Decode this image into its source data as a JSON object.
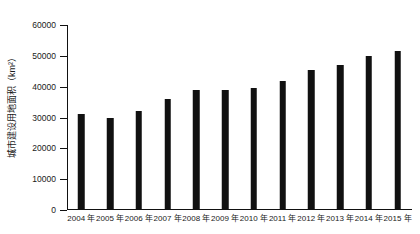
{
  "chart_data": {
    "type": "bar",
    "title": "",
    "xlabel": "",
    "ylabel": "城市建设用地面积（km²）",
    "ylim": [
      0,
      60000
    ],
    "ytick_step": 10000,
    "yticks": [
      "0",
      "10000",
      "20000",
      "30000",
      "40000",
      "50000",
      "60000"
    ],
    "ytick_values": [
      0,
      10000,
      20000,
      30000,
      40000,
      50000,
      60000
    ],
    "grid": false,
    "legend": false,
    "bar_color": "#111111",
    "axis_color": "#111111",
    "categories": [
      "2004 年",
      "2005 年",
      "2006 年",
      "2007 年",
      "2008 年",
      "2009 年",
      "2010 年",
      "2011 年",
      "2012 年",
      "2013 年",
      "2014 年",
      "2015 年"
    ],
    "values": [
      31000,
      30000,
      32000,
      36000,
      39000,
      39000,
      39500,
      42000,
      45500,
      47000,
      50000,
      51500
    ]
  }
}
